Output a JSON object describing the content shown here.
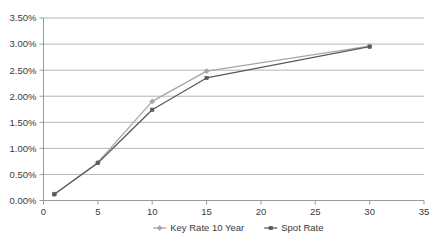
{
  "chart_data": {
    "type": "line",
    "title": "",
    "xlabel": "",
    "ylabel": "",
    "xlim": [
      0,
      35
    ],
    "ylim": [
      0,
      0.035
    ],
    "grid": true,
    "grid_axis": "y",
    "legend_position": "bottom",
    "x": [
      1,
      5,
      10,
      15,
      30
    ],
    "x_ticks": [
      0,
      5,
      10,
      15,
      20,
      25,
      30,
      35
    ],
    "x_tick_labels": [
      "0",
      "5",
      "10",
      "15",
      "20",
      "25",
      "30",
      "35"
    ],
    "y_ticks": [
      0.0,
      0.005,
      0.01,
      0.015,
      0.02,
      0.025,
      0.03,
      0.035
    ],
    "y_tick_labels": [
      "0.00%",
      "0.50%",
      "1.00%",
      "1.50%",
      "2.00%",
      "2.50%",
      "3.00%",
      "3.50%"
    ],
    "series": [
      {
        "name": "Key Rate 10 Year",
        "color": "#A6A6A6",
        "marker": "diamond",
        "values": [
          0.0012,
          0.0073,
          0.019,
          0.0248,
          0.0296
        ],
        "value_labels": [
          "0.12%",
          "0.73%",
          "1.90%",
          "2.48%",
          "2.96%"
        ]
      },
      {
        "name": "Spot Rate",
        "color": "#5A5A5A",
        "marker": "square",
        "values": [
          0.0012,
          0.0072,
          0.0174,
          0.0235,
          0.0295
        ],
        "value_labels": [
          "0.12%",
          "0.72%",
          "1.74%",
          "2.35%",
          "2.95%"
        ]
      }
    ]
  },
  "legend": {
    "items": [
      {
        "label": "Key Rate 10 Year",
        "color": "#A6A6A6"
      },
      {
        "label": "Spot Rate",
        "color": "#5A5A5A"
      }
    ]
  },
  "axes": {
    "y_labels": [
      "3.50%",
      "3.00%",
      "2.50%",
      "2.00%",
      "1.50%",
      "1.00%",
      "0.50%",
      "0.00%"
    ],
    "x_labels": [
      "0",
      "5",
      "10",
      "15",
      "20",
      "25",
      "30",
      "35"
    ]
  },
  "colors": {
    "gridline": "#B5B5B5",
    "axis": "#9A9A9A",
    "background": "#FFFFFF",
    "text": "#3A3A3A"
  }
}
